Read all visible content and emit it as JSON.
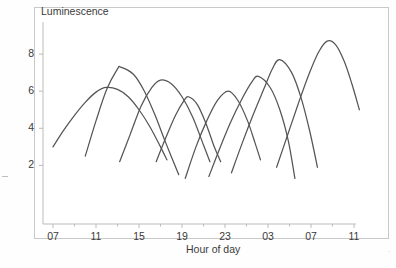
{
  "figure": {
    "background_color": "#ffffff",
    "frame_color": "#c9c9c9",
    "curve_color": "#555555",
    "axis_color": "#bbbbbb",
    "text_color": "#3a3a3a"
  },
  "chart_data": {
    "type": "line",
    "title": "",
    "xlabel": "Hour of day",
    "ylabel": "Luminescence",
    "grid": false,
    "legend": null,
    "xlim": [
      6,
      34
    ],
    "ylim": [
      0,
      9.4
    ],
    "x_tick_labels": [
      "07",
      "11",
      "15",
      "19",
      "23",
      "03",
      "07",
      "11"
    ],
    "x_tick_values": [
      7,
      11,
      15,
      19,
      23,
      27,
      31,
      35
    ],
    "x_minor_tick_values": [
      9,
      13,
      17,
      21,
      25,
      29,
      33
    ],
    "y_tick_labels": [
      "2",
      "4",
      "6",
      "8"
    ],
    "y_tick_values": [
      2,
      4,
      6,
      8
    ],
    "series": [
      {
        "name": "cycle-1",
        "peak_hour": 11.9,
        "peak_value": 6.2,
        "x_start": 7.0,
        "x_end": 17.6,
        "y_start": 3.0,
        "y_end": 2.3,
        "x": [
          7.0,
          8.0,
          9.0,
          10.0,
          11.0,
          11.9,
          13.0,
          14.0,
          15.0,
          16.0,
          17.0,
          17.6
        ],
        "y": [
          3.0,
          3.9,
          4.7,
          5.4,
          5.95,
          6.2,
          6.1,
          5.7,
          5.0,
          4.1,
          3.0,
          2.3
        ]
      },
      {
        "name": "cycle-2",
        "peak_hour": 13.3,
        "peak_value": 7.3,
        "x_start": 10.0,
        "x_end": 18.7,
        "y_start": 2.5,
        "y_end": 1.5,
        "x": [
          10.0,
          11.0,
          12.0,
          13.0,
          13.3,
          14.5,
          15.5,
          16.5,
          17.5,
          18.7
        ],
        "y": [
          2.5,
          4.4,
          6.1,
          7.2,
          7.3,
          6.9,
          6.0,
          4.7,
          3.2,
          1.5
        ]
      },
      {
        "name": "cycle-3",
        "peak_hour": 17.0,
        "peak_value": 6.6,
        "x_start": 13.2,
        "x_end": 21.6,
        "y_start": 2.2,
        "y_end": 2.2,
        "x": [
          13.2,
          14.2,
          15.2,
          16.2,
          17.0,
          18.0,
          19.0,
          20.0,
          21.0,
          21.6
        ],
        "y": [
          2.2,
          3.7,
          5.2,
          6.2,
          6.6,
          6.4,
          5.7,
          4.6,
          3.1,
          2.2
        ]
      },
      {
        "name": "cycle-4",
        "peak_hour": 19.6,
        "peak_value": 5.7,
        "x_start": 16.6,
        "x_end": 22.6,
        "y_start": 2.2,
        "y_end": 2.2,
        "x": [
          16.6,
          17.5,
          18.4,
          19.2,
          19.6,
          20.4,
          21.2,
          22.0,
          22.6
        ],
        "y": [
          2.2,
          3.5,
          4.7,
          5.5,
          5.7,
          5.3,
          4.3,
          3.0,
          2.2
        ]
      },
      {
        "name": "cycle-5",
        "peak_hour": 23.3,
        "peak_value": 6.0,
        "x_start": 19.3,
        "x_end": 26.3,
        "y_start": 1.3,
        "y_end": 2.3,
        "x": [
          19.3,
          20.3,
          21.3,
          22.3,
          23.3,
          24.2,
          25.1,
          25.8,
          26.3
        ],
        "y": [
          1.3,
          3.0,
          4.4,
          5.5,
          6.0,
          5.5,
          4.4,
          3.2,
          2.3
        ]
      },
      {
        "name": "cycle-6",
        "peak_hour": 26.1,
        "peak_value": 6.8,
        "x_start": 21.5,
        "x_end": 29.5,
        "y_start": 1.4,
        "y_end": 1.3,
        "x": [
          21.5,
          22.5,
          23.5,
          24.5,
          25.5,
          26.1,
          27.2,
          28.1,
          28.9,
          29.5
        ],
        "y": [
          1.4,
          2.9,
          4.3,
          5.5,
          6.5,
          6.8,
          6.2,
          5.0,
          3.3,
          1.3
        ]
      },
      {
        "name": "cycle-7",
        "peak_hour": 28.1,
        "peak_value": 7.7,
        "x_start": 23.6,
        "x_end": 31.6,
        "y_start": 1.6,
        "y_end": 1.9,
        "x": [
          23.6,
          24.6,
          25.6,
          26.6,
          27.4,
          28.1,
          29.2,
          30.1,
          30.9,
          31.6
        ],
        "y": [
          1.6,
          3.2,
          4.7,
          6.1,
          7.2,
          7.7,
          7.0,
          5.6,
          3.8,
          1.9
        ]
      },
      {
        "name": "cycle-8",
        "peak_hour": 32.5,
        "peak_value": 8.7,
        "x_start": 27.8,
        "x_end": 35.5,
        "y_start": 1.9,
        "y_end": 5.0,
        "x": [
          27.8,
          28.8,
          29.8,
          30.8,
          31.7,
          32.5,
          33.3,
          34.1,
          34.8,
          35.5
        ],
        "y": [
          1.9,
          3.6,
          5.3,
          6.9,
          8.1,
          8.7,
          8.5,
          7.6,
          6.4,
          5.0
        ]
      }
    ]
  },
  "annotations": {
    "left_edge_mark": "",
    "bottom_right_mark": "´"
  }
}
